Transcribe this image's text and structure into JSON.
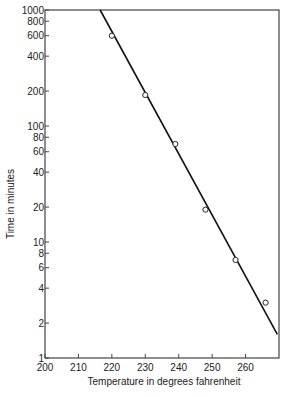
{
  "chart_data": {
    "type": "scatter",
    "title": "",
    "xlabel": "Temperature in degrees fahrenheit",
    "ylabel": "Time in minutes",
    "xlim": [
      200,
      270
    ],
    "ylim": [
      1,
      1000
    ],
    "yscale": "log",
    "grid": false,
    "x_ticks": [
      "200",
      "210",
      "220",
      "230",
      "240",
      "250",
      "260"
    ],
    "y_ticks": [
      "1",
      "2",
      "4",
      "6",
      "8",
      "10",
      "20",
      "40",
      "60",
      "80",
      "100",
      "200",
      "400",
      "600",
      "800",
      "1000"
    ],
    "series": [
      {
        "name": "observed",
        "marker": "open-circle",
        "x": [
          220,
          230,
          239,
          248,
          257,
          266
        ],
        "y": [
          600,
          185,
          70,
          19,
          7,
          3
        ]
      },
      {
        "name": "fit-line",
        "style": "line",
        "x": [
          216.5,
          269.5
        ],
        "y": [
          1000,
          1.6
        ]
      }
    ]
  }
}
